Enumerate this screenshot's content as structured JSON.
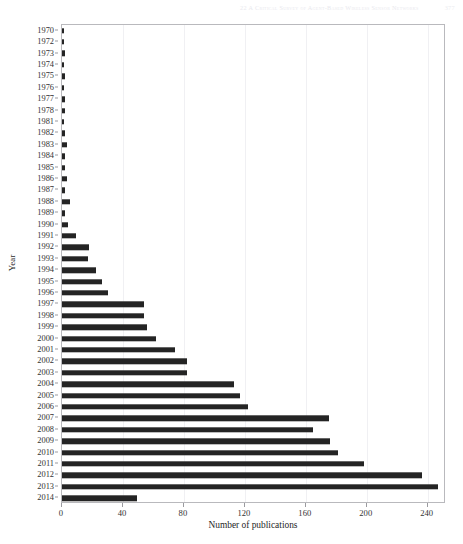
{
  "page_header": {
    "text": "22  A Critical Survey of Agent-Based Wireless Sensor Networks",
    "page_number": "377"
  },
  "chart_data": {
    "type": "bar",
    "orientation": "horizontal",
    "title": "",
    "xlabel": "Number of publications",
    "ylabel": "Year",
    "xlim": [
      0,
      252
    ],
    "ylim": null,
    "grid": true,
    "legend": null,
    "bar_color": "#242424",
    "xticks": [
      0,
      40,
      80,
      120,
      160,
      200,
      240
    ],
    "xtick_labels": [
      "0",
      "40",
      "80",
      "120",
      "160",
      "200",
      "240"
    ],
    "categories": [
      "1970",
      "1972",
      "1973",
      "1974",
      "1975",
      "1976",
      "1977",
      "1978",
      "1981",
      "1982",
      "1983",
      "1984",
      "1985",
      "1986",
      "1987",
      "1988",
      "1989",
      "1990",
      "1991",
      "1992",
      "1993",
      "1994",
      "1995",
      "1996",
      "1997",
      "1998",
      "1999",
      "2000",
      "2001",
      "2002",
      "2003",
      "2004",
      "2005",
      "2006",
      "2007",
      "2008",
      "2009",
      "2010",
      "2011",
      "2012",
      "2013",
      "2014"
    ],
    "values": [
      1,
      1,
      2,
      1,
      2,
      1,
      2,
      2,
      1,
      2,
      3,
      2,
      2,
      3,
      2,
      5,
      2,
      4,
      9,
      18,
      17,
      22,
      26,
      30,
      54,
      54,
      56,
      62,
      74,
      82,
      82,
      113,
      117,
      122,
      175,
      165,
      176,
      181,
      198,
      236,
      247,
      49
    ]
  }
}
